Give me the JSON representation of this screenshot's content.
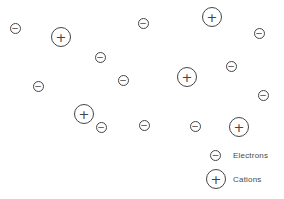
{
  "diagram": {
    "background_color": "#ffffff",
    "stroke_color": "#454545",
    "electron_symbol": "−",
    "cation_symbol": "+",
    "electron_diameter_px": 11,
    "cation_diameter_px": 20,
    "particles": [
      {
        "type": "electron",
        "x": 15,
        "y": 28
      },
      {
        "type": "cation",
        "x": 61,
        "y": 37
      },
      {
        "type": "electron",
        "x": 100,
        "y": 57
      },
      {
        "type": "electron",
        "x": 143,
        "y": 23
      },
      {
        "type": "cation",
        "x": 212,
        "y": 17
      },
      {
        "type": "electron",
        "x": 259,
        "y": 33
      },
      {
        "type": "electron",
        "x": 231,
        "y": 66
      },
      {
        "type": "cation",
        "x": 187,
        "y": 77
      },
      {
        "type": "electron",
        "x": 123,
        "y": 80
      },
      {
        "type": "electron",
        "x": 38,
        "y": 86
      },
      {
        "type": "electron",
        "x": 263,
        "y": 95
      },
      {
        "type": "cation",
        "x": 84,
        "y": 114
      },
      {
        "type": "electron",
        "x": 101,
        "y": 127
      },
      {
        "type": "electron",
        "x": 144,
        "y": 125
      },
      {
        "type": "electron",
        "x": 195,
        "y": 126
      },
      {
        "type": "cation",
        "x": 239,
        "y": 127
      }
    ],
    "legend": {
      "items": [
        {
          "type": "electron",
          "label": "Electrons"
        },
        {
          "type": "cation",
          "label": "Cations"
        }
      ]
    }
  }
}
